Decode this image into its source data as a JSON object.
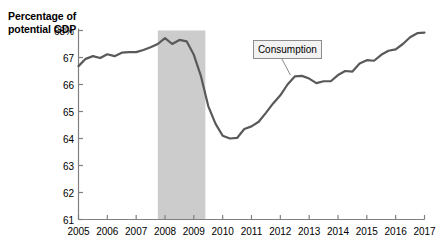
{
  "chart_data": {
    "type": "line",
    "title": "",
    "subtitle": "",
    "ylabel": "Percentage of potential GDP",
    "xlabel": "",
    "ylim": [
      61,
      68
    ],
    "xlim": [
      2005,
      2017
    ],
    "grid": false,
    "legend_position": "inline-callout",
    "y_tick_labels": [
      "68%",
      "67",
      "66",
      "65",
      "64",
      "63",
      "62",
      "61"
    ],
    "y_ticks": [
      68,
      67,
      66,
      65,
      64,
      63,
      62,
      61
    ],
    "x_tick_labels": [
      "2005",
      "2006",
      "2007",
      "2008",
      "2009",
      "2010",
      "2011",
      "2012",
      "2013",
      "2014",
      "2015",
      "2016",
      "2017"
    ],
    "x_ticks": [
      2005,
      2006,
      2007,
      2008,
      2009,
      2010,
      2011,
      2012,
      2013,
      2014,
      2015,
      2016,
      2017
    ],
    "annotations": [
      {
        "name": "consumption-callout",
        "text": "Consumption",
        "box_x": 2011.05,
        "box_y": 67.65,
        "point_x": 2012.35,
        "point_y": 66.35
      }
    ],
    "shaded_regions": [
      {
        "name": "recession-band",
        "label": "",
        "x_start": 2007.75,
        "x_end": 2009.4,
        "color": "#cccccc"
      }
    ],
    "series": [
      {
        "name": "Consumption",
        "color": "#595959",
        "width": 2.2,
        "x": [
          2005.0,
          2005.25,
          2005.5,
          2005.75,
          2006.0,
          2006.25,
          2006.5,
          2006.75,
          2007.0,
          2007.25,
          2007.5,
          2007.75,
          2008.0,
          2008.25,
          2008.5,
          2008.75,
          2009.0,
          2009.25,
          2009.5,
          2009.75,
          2010.0,
          2010.25,
          2010.5,
          2010.75,
          2011.0,
          2011.25,
          2011.5,
          2011.75,
          2012.0,
          2012.25,
          2012.5,
          2012.75,
          2013.0,
          2013.25,
          2013.5,
          2013.75,
          2014.0,
          2014.25,
          2014.5,
          2014.75,
          2015.0,
          2015.25,
          2015.5,
          2015.75,
          2016.0,
          2016.25,
          2016.5,
          2016.75,
          2017.0
        ],
        "values": [
          66.68,
          66.95,
          67.05,
          66.98,
          67.12,
          67.05,
          67.18,
          67.2,
          67.2,
          67.28,
          67.38,
          67.5,
          67.72,
          67.5,
          67.65,
          67.6,
          67.1,
          66.3,
          65.2,
          64.55,
          64.1,
          64.0,
          64.02,
          64.35,
          64.45,
          64.62,
          64.95,
          65.3,
          65.6,
          66.0,
          66.3,
          66.32,
          66.22,
          66.05,
          66.12,
          66.12,
          66.35,
          66.5,
          66.48,
          66.78,
          66.9,
          66.88,
          67.1,
          67.25,
          67.3,
          67.5,
          67.75,
          67.9,
          67.92
        ]
      }
    ]
  },
  "axis": {
    "y_title_line1": "Percentage of",
    "y_title_line2": "potential GDP"
  },
  "colors": {
    "line": "#595959",
    "axis": "#808080",
    "shade": "#cccccc",
    "callout_fill": "#f2f2f2",
    "callout_border": "#8c8c8c",
    "background": "#ffffff"
  }
}
